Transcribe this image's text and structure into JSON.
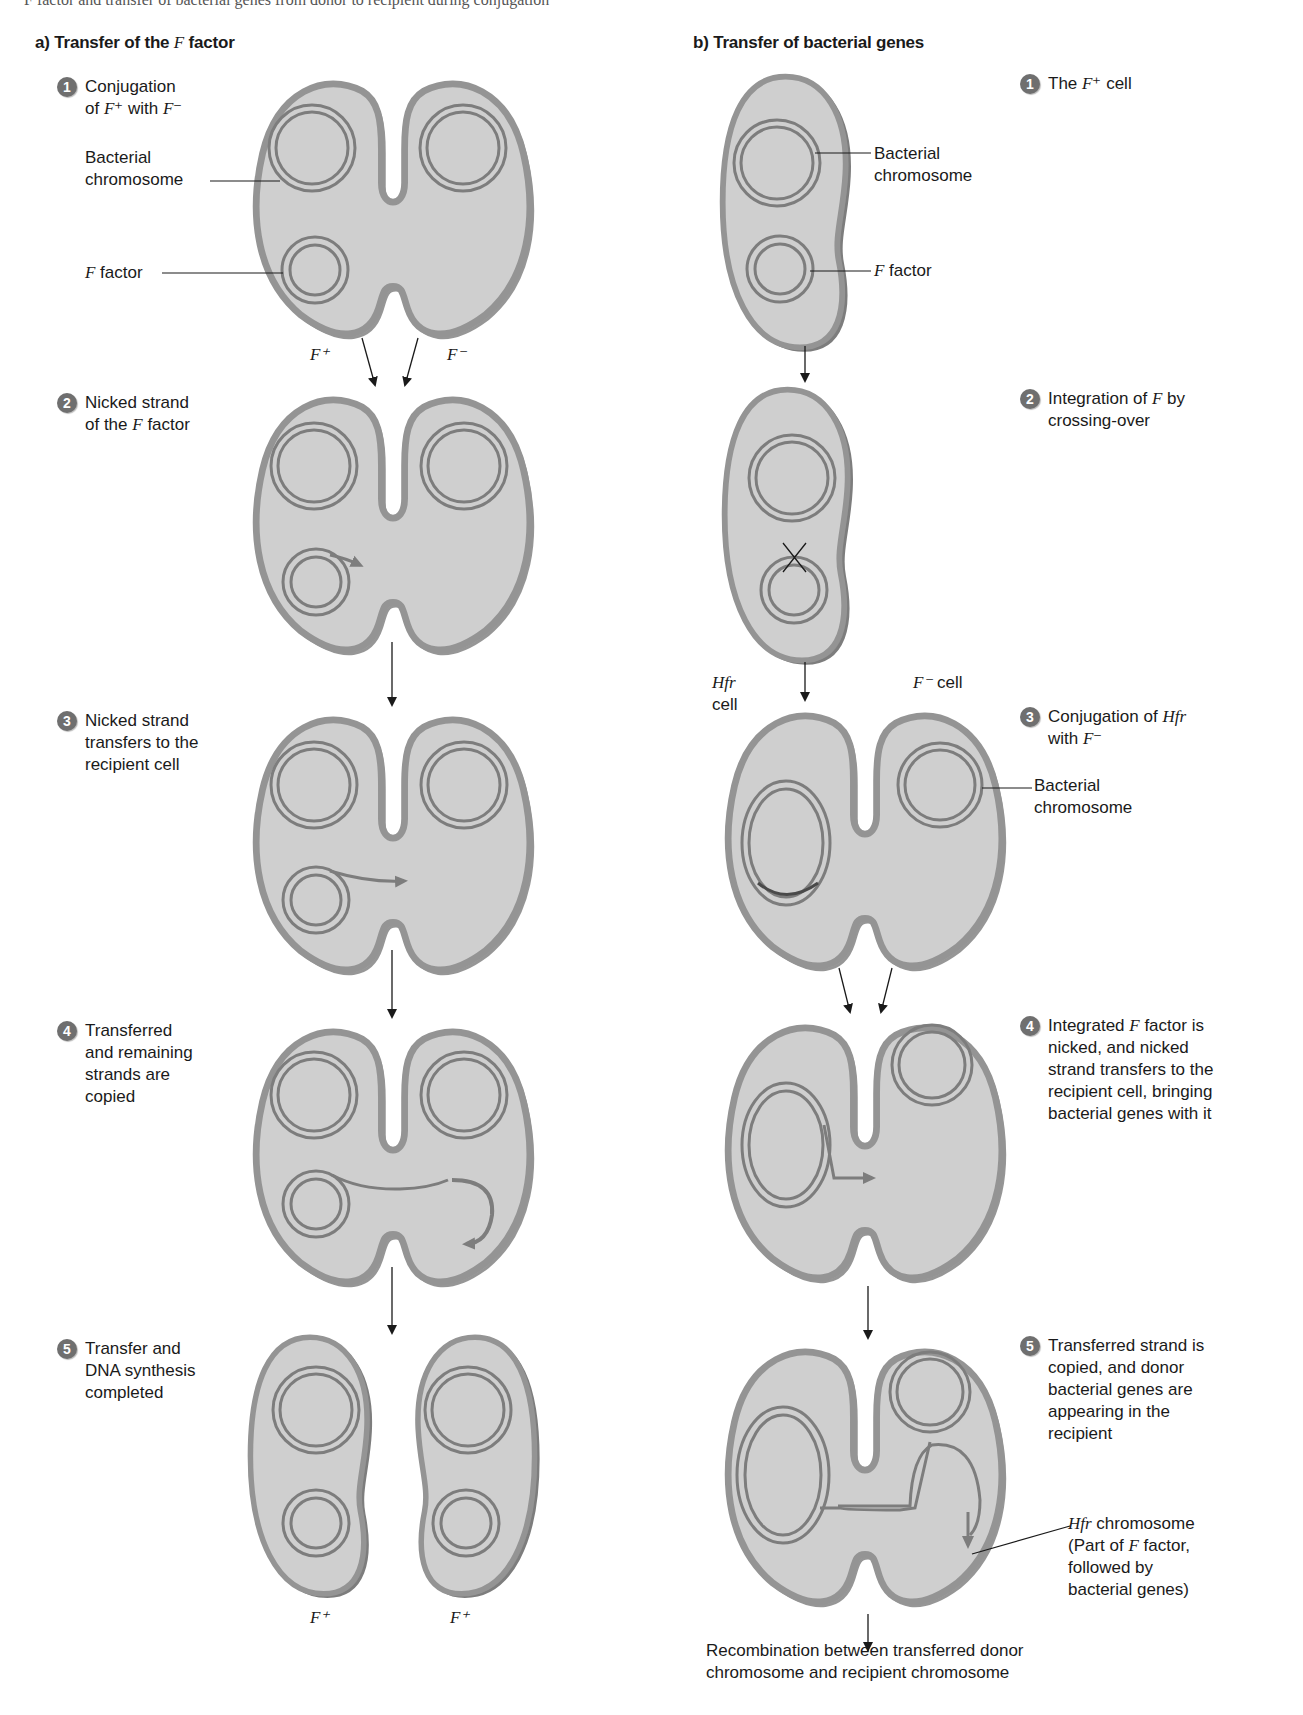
{
  "page": {
    "cutoff_top_text": "F factor and transfer of bacterial genes from donor to recipient during conjugation",
    "figure_title": "Conjugation: transfer of the F factor and transfer of bacterial genes"
  },
  "panel_a": {
    "title_prefix": "a) Transfer of the ",
    "title_italic": "F",
    "title_suffix": " factor",
    "steps": [
      {
        "num": "1",
        "text_parts": [
          "Conjugation\nof ",
          "F",
          "⁺ with ",
          "F",
          "⁻"
        ]
      },
      {
        "num": "2",
        "text_parts": [
          "Nicked strand\nof the ",
          "F",
          " factor"
        ]
      },
      {
        "num": "3",
        "text": "Nicked strand\ntransfers to the\nrecipient cell"
      },
      {
        "num": "4",
        "text": "Transferred\nand remaining\nstrands are\ncopied"
      },
      {
        "num": "5",
        "text": "Transfer and\nDNA synthesis\ncompleted"
      }
    ],
    "labels": {
      "bacterial_chromosome": "Bacterial\nchromosome",
      "f_factor_italic": "F",
      "f_factor_suffix": " factor"
    },
    "cell_labels": {
      "step1_left": "F⁺",
      "step1_right": "F⁻",
      "step5_left": "F⁺",
      "step5_right": "F⁺"
    }
  },
  "panel_b": {
    "title": "b) Transfer of bacterial genes",
    "steps": [
      {
        "num": "1",
        "text_parts": [
          "The ",
          "F",
          "⁺ cell"
        ]
      },
      {
        "num": "2",
        "text_parts": [
          "Integration of ",
          "F",
          " by\ncrossing-over"
        ]
      },
      {
        "num": "3",
        "text_parts": [
          "Conjugation of ",
          "Hfr",
          "\nwith ",
          "F",
          "⁻"
        ]
      },
      {
        "num": "4",
        "text_parts": [
          "Integrated ",
          "F",
          " factor is\nnicked, and nicked\nstrand transfers to the\nrecipient cell, bringing\nbacterial genes with it"
        ]
      },
      {
        "num": "5",
        "text": "Transferred strand is\ncopied, and donor\nbacterial genes are\nappearing in the\nrecipient"
      }
    ],
    "labels": {
      "bacterial_chromosome_1": "Bacterial\nchromosome",
      "f_factor_italic": "F",
      "f_factor_suffix": " factor",
      "hfr_cell_italic": "Hfr",
      "hfr_cell_suffix": "cell",
      "f_minus_cell_italic": "F⁻",
      "f_minus_cell_suffix": " cell",
      "bacterial_chromosome_3": "Bacterial\nchromosome",
      "hfr_chromosome_italic": "Hfr",
      "hfr_chromosome_suffix": " chromosome\n(Part of ",
      "hfr_chromosome_f": "F",
      "hfr_chromosome_rest": " factor,\nfollowed by\nbacterial genes)"
    },
    "final_outcome": "Recombination between transferred donor\nchromosome and recipient chromosome"
  },
  "colors": {
    "cell_fill": "#cfcfcf",
    "cell_border": "#8f8f8f",
    "cell_shadow": "#7a7a7a",
    "dna_strand": "#7d7d7d",
    "badge": "#6f6f6f",
    "arrow": "#1a1a1a",
    "text": "#1a1a1a"
  }
}
